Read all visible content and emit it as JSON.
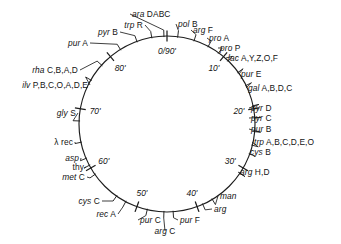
{
  "figure": {
    "type": "circular-genetic-map",
    "organism_map_title": "",
    "units": "minutes",
    "circle": {
      "cx": 167,
      "cy": 124,
      "r": 88,
      "stroke": "#1d1d1d"
    },
    "background": "#ffffff"
  },
  "time_markers": [
    {
      "label": "0/90'",
      "minute": 0,
      "angle_deg": -90,
      "placement": "inside"
    },
    {
      "label": "10'",
      "minute": 10,
      "angle_deg": -50,
      "placement": "inside"
    },
    {
      "label": "20'",
      "minute": 20,
      "angle_deg": -10,
      "placement": "inside"
    },
    {
      "label": "30'",
      "minute": 30,
      "angle_deg": 30,
      "placement": "inside"
    },
    {
      "label": "40'",
      "minute": 40,
      "angle_deg": 70,
      "placement": "inside"
    },
    {
      "label": "50'",
      "minute": 50,
      "angle_deg": 110,
      "placement": "inside"
    },
    {
      "label": "60'",
      "minute": 60,
      "angle_deg": 150,
      "placement": "inside"
    },
    {
      "label": "70'",
      "minute": 70,
      "angle_deg": 190,
      "placement": "inside"
    },
    {
      "label": "80'",
      "minute": 80,
      "angle_deg": 230,
      "placement": "inside"
    }
  ],
  "gene_loci": [
    {
      "gene": "ara",
      "alleles": "DABC",
      "angle_deg": -92,
      "label_x": 132,
      "label_y": 14,
      "anchor": "w",
      "lead": true
    },
    {
      "gene": "pol",
      "alleles": "B",
      "angle_deg": -83,
      "label_x": 178,
      "label_y": 24,
      "anchor": "w",
      "lead": true
    },
    {
      "gene": "trp",
      "alleles": "R",
      "angle_deg": -100,
      "label_x": 143,
      "label_y": 25,
      "anchor": "e",
      "lead": true
    },
    {
      "gene": "pyr",
      "alleles": "B",
      "angle_deg": -110,
      "label_x": 118,
      "label_y": 32,
      "anchor": "e",
      "lead": true
    },
    {
      "gene": "pur",
      "alleles": "A",
      "angle_deg": -122,
      "label_x": 88,
      "label_y": 43,
      "anchor": "e",
      "lead": true
    },
    {
      "gene": "rha",
      "alleles": "C,B,A,D",
      "angle_deg": -138,
      "label_x": 78,
      "label_y": 70,
      "anchor": "e",
      "lead": true
    },
    {
      "gene": "ilv",
      "alleles": "P,B,C,O,A,D,E",
      "angle_deg": -150,
      "label_x": 88,
      "label_y": 85,
      "anchor": "e",
      "lead": true
    },
    {
      "gene": "gly",
      "alleles": "S",
      "angle_deg": -178,
      "label_x": 76,
      "label_y": 113,
      "anchor": "e",
      "lead": true
    },
    {
      "gene": "λ",
      "alleles": "rec",
      "angle_deg": 168,
      "label_x": 73,
      "label_y": 142,
      "anchor": "e",
      "lead": true,
      "gene_upright": true
    },
    {
      "gene": "asp",
      "alleles": "",
      "angle_deg": 157,
      "label_x": 79,
      "label_y": 158,
      "anchor": "e",
      "lead": true
    },
    {
      "gene": "thy",
      "alleles": "",
      "angle_deg": 152,
      "label_x": 84,
      "label_y": 167,
      "anchor": "e",
      "lead": true,
      "gene_upright": true
    },
    {
      "gene": "met",
      "alleles": "C",
      "angle_deg": 145,
      "label_x": 85,
      "label_y": 177,
      "anchor": "e",
      "lead": true
    },
    {
      "gene": "cys",
      "alleles": "C",
      "angle_deg": 125,
      "label_x": 100,
      "label_y": 201,
      "anchor": "e",
      "lead": true
    },
    {
      "gene": "rec",
      "alleles": "A",
      "angle_deg": 118,
      "label_x": 116,
      "label_y": 214,
      "anchor": "e",
      "lead": true
    },
    {
      "gene": "pur",
      "alleles": "C",
      "angle_deg": 103,
      "label_x": 140,
      "label_y": 220,
      "anchor": "w",
      "lead": true
    },
    {
      "gene": "arg",
      "alleles": "C",
      "angle_deg": 92,
      "label_x": 165,
      "label_y": 231,
      "anchor": "c",
      "lead": true
    },
    {
      "gene": "pur",
      "alleles": "F",
      "angle_deg": 86,
      "label_x": 180,
      "label_y": 220,
      "anchor": "w",
      "lead": true
    },
    {
      "gene": "arg",
      "alleles": "",
      "angle_deg": 66,
      "label_x": 214,
      "label_y": 209,
      "anchor": "w",
      "lead": true
    },
    {
      "gene": "man",
      "alleles": "",
      "angle_deg": 59,
      "label_x": 220,
      "label_y": 196,
      "anchor": "w",
      "lead": true
    },
    {
      "gene": "arg",
      "alleles": "H,D",
      "angle_deg": 34,
      "label_x": 240,
      "label_y": 172,
      "anchor": "w",
      "lead": true
    },
    {
      "gene": "cys",
      "alleles": "B",
      "angle_deg": 20,
      "label_x": 250,
      "label_y": 152,
      "anchor": "w",
      "lead": false
    },
    {
      "gene": "trp",
      "alleles": "A,B,C,D,E,O",
      "angle_deg": 14,
      "label_x": 254,
      "label_y": 142,
      "anchor": "w",
      "lead": true
    },
    {
      "gene": "pur",
      "alleles": "B",
      "angle_deg": 5,
      "label_x": 251,
      "label_y": 129,
      "anchor": "w",
      "lead": true
    },
    {
      "gene": "pyr",
      "alleles": "C",
      "angle_deg": -4,
      "label_x": 251,
      "label_y": 118,
      "anchor": "w",
      "lead": true
    },
    {
      "gene": "pyr",
      "alleles": "D",
      "angle_deg": -12,
      "label_x": 251,
      "label_y": 108,
      "anchor": "w",
      "lead": true
    },
    {
      "gene": "gal",
      "alleles": "A,B,D,C",
      "angle_deg": -26,
      "label_x": 248,
      "label_y": 88,
      "anchor": "w",
      "lead": true
    },
    {
      "gene": "pur",
      "alleles": "E",
      "angle_deg": -36,
      "label_x": 241,
      "label_y": 74,
      "anchor": "w",
      "lead": true
    },
    {
      "gene": "lac",
      "alleles": "A,Y,Z,O,F",
      "angle_deg": -46,
      "label_x": 228,
      "label_y": 58,
      "anchor": "w",
      "lead": true
    },
    {
      "gene": "pro",
      "alleles": "P",
      "angle_deg": -54,
      "label_x": 220,
      "label_y": 48,
      "anchor": "w",
      "lead": true
    },
    {
      "gene": "pro",
      "alleles": "A",
      "angle_deg": -62,
      "label_x": 209,
      "label_y": 38,
      "anchor": "w",
      "lead": true
    },
    {
      "gene": "arg",
      "alleles": "F",
      "angle_deg": -72,
      "label_x": 193,
      "label_y": 30,
      "anchor": "w",
      "lead": true
    }
  ]
}
